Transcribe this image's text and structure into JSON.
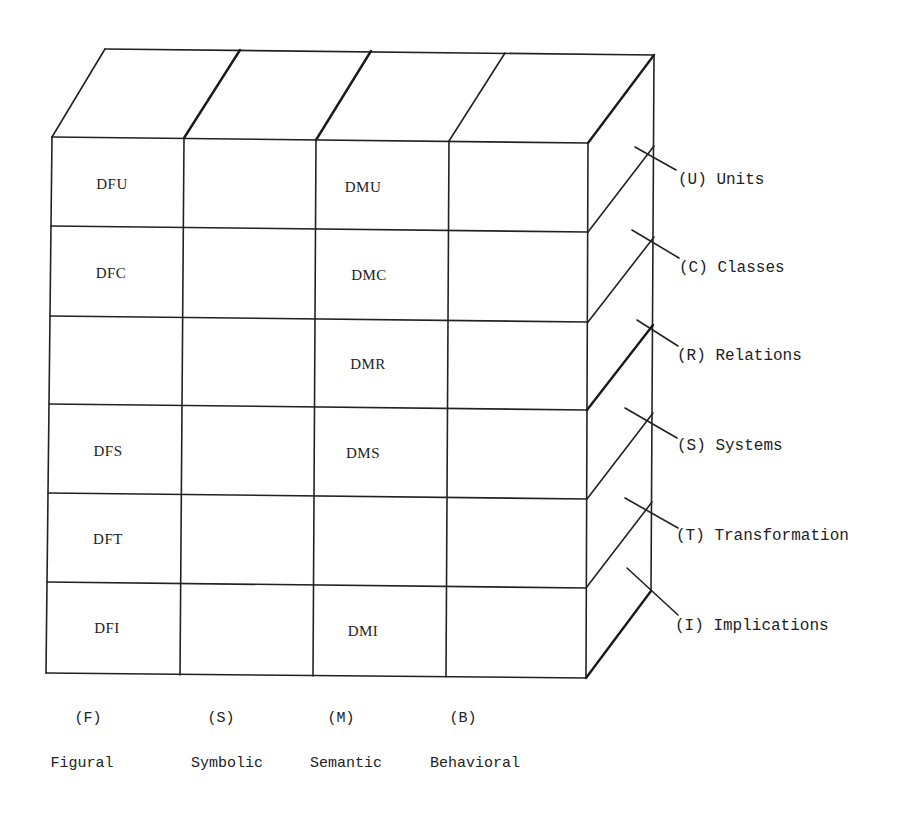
{
  "diagram": {
    "type": "structure-of-intellect-cube-face",
    "columns": [
      {
        "code": "(F)",
        "name": "Figural"
      },
      {
        "code": "(S)",
        "name": "Symbolic"
      },
      {
        "code": "(M)",
        "name": "Semantic"
      },
      {
        "code": "(B)",
        "name": "Behavioral"
      }
    ],
    "rows": [
      {
        "code": "(U)",
        "name": "Units",
        "label": "(U) Units"
      },
      {
        "code": "(C)",
        "name": "Classes",
        "label": "(C) Classes"
      },
      {
        "code": "(R)",
        "name": "Relations",
        "label": "(R) Relations"
      },
      {
        "code": "(S)",
        "name": "Systems",
        "label": "(S) Systems"
      },
      {
        "code": "(T)",
        "name": "Transformation",
        "label": "(T) Transformation"
      },
      {
        "code": "(I)",
        "name": "Implications",
        "label": "(I) Implications"
      }
    ],
    "cells": [
      [
        "DFU",
        "",
        "DMU",
        ""
      ],
      [
        "DFC",
        "",
        "DMC",
        ""
      ],
      [
        "",
        "",
        "DMR",
        ""
      ],
      [
        "DFS",
        "",
        "DMS",
        ""
      ],
      [
        "DFT",
        "",
        "",
        ""
      ],
      [
        "DFI",
        "",
        "DMI",
        ""
      ]
    ]
  }
}
